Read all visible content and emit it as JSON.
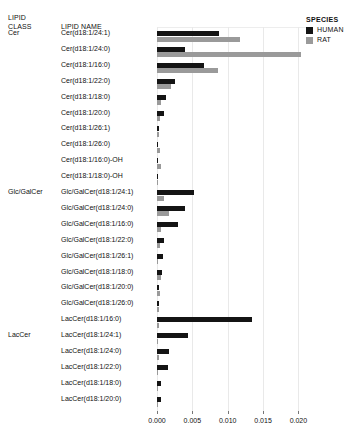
{
  "headers": {
    "lipid_class": "LIPID\nCLASS",
    "lipid_class_line1": "LIPID",
    "lipid_class_line2": "CLASS",
    "lipid_name": "LIPID NAME"
  },
  "legend": {
    "title": "SPECIES",
    "items": [
      {
        "label": "HUMAN",
        "color": "#141414",
        "swatch": "legend-swatch-human"
      },
      {
        "label": "RAT",
        "color": "#9a9a9a",
        "swatch": "legend-swatch-rat"
      }
    ]
  },
  "classes": [
    {
      "name": "Cer",
      "row_index": 0
    },
    {
      "name": "Glc/GalCer",
      "row_index": 10
    },
    {
      "name": "LacCer",
      "row_index": 19
    }
  ],
  "chart_data": {
    "type": "bar",
    "orientation": "horizontal",
    "title": "",
    "xlabel": "",
    "ylabel": "",
    "xlim": [
      0,
      0.0215
    ],
    "xticks": [
      0.0,
      0.005,
      0.01,
      0.015,
      0.02
    ],
    "xticklabels": [
      "0.000",
      "0.005",
      "0.010",
      "0.015",
      "0.020"
    ],
    "grid": true,
    "legend_position": "right-top",
    "group_key": "LIPID CLASS",
    "categories": [
      "Cer(d18:1/24:1)",
      "Cer(d18:1/24:0)",
      "Cer(d18:1/16:0)",
      "Cer(d18:1/22:0)",
      "Cer(d18:1/18:0)",
      "Cer(d18:1/20:0)",
      "Cer(d18:1/26:1)",
      "Cer(d18:1/26:0)",
      "Cer(d18:1/16:0)-OH",
      "Cer(d18:1/18:0)-OH",
      "Glc/GalCer(d18:1/24:1)",
      "Glc/GalCer(d18:1/24:0)",
      "Glc/GalCer(d18:1/16:0)",
      "Glc/GalCer(d18:1/22:0)",
      "Glc/GalCer(d18:1/26:1)",
      "Glc/GalCer(d18:1/18:0)",
      "Glc/GalCer(d18:1/20:0)",
      "Glc/GalCer(d18:1/26:0)",
      "LacCer(d18:1/16:0)",
      "LacCer(d18:1/24:1)",
      "LacCer(d18:1/24:0)",
      "LacCer(d18:1/22:0)",
      "LacCer(d18:1/18:0)",
      "LacCer(d18:1/20:0)"
    ],
    "lipid_class_of_category": [
      "Cer",
      "Cer",
      "Cer",
      "Cer",
      "Cer",
      "Cer",
      "Cer",
      "Cer",
      "Cer",
      "Cer",
      "Glc/GalCer",
      "Glc/GalCer",
      "Glc/GalCer",
      "Glc/GalCer",
      "Glc/GalCer",
      "Glc/GalCer",
      "Glc/GalCer",
      "Glc/GalCer",
      "LacCer",
      "LacCer",
      "LacCer",
      "LacCer",
      "LacCer",
      "LacCer"
    ],
    "series": [
      {
        "name": "HUMAN",
        "color": "#141414",
        "values": [
          0.00875,
          0.004,
          0.00665,
          0.0025,
          0.0013,
          0.001,
          0.0003,
          0.0002,
          0.00012,
          8e-05,
          0.0053,
          0.004,
          0.003,
          0.00105,
          0.0008,
          0.00075,
          0.0003,
          0.00022,
          0.0135,
          0.0044,
          0.00175,
          0.0015,
          0.0006,
          0.0005
        ]
      },
      {
        "name": "RAT",
        "color": "#9a9a9a",
        "values": [
          0.0118,
          0.0203,
          0.0086,
          0.00195,
          0.0006,
          0.00042,
          0.0003,
          0.0004,
          0.00055,
          5e-05,
          0.00095,
          0.00165,
          0.00055,
          0.0004,
          7e-05,
          0.00055,
          0.00042,
          0.00025,
          0.0003,
          0.0002,
          0.00022,
          0.00018,
          0.00012,
          0.0001
        ]
      }
    ]
  }
}
